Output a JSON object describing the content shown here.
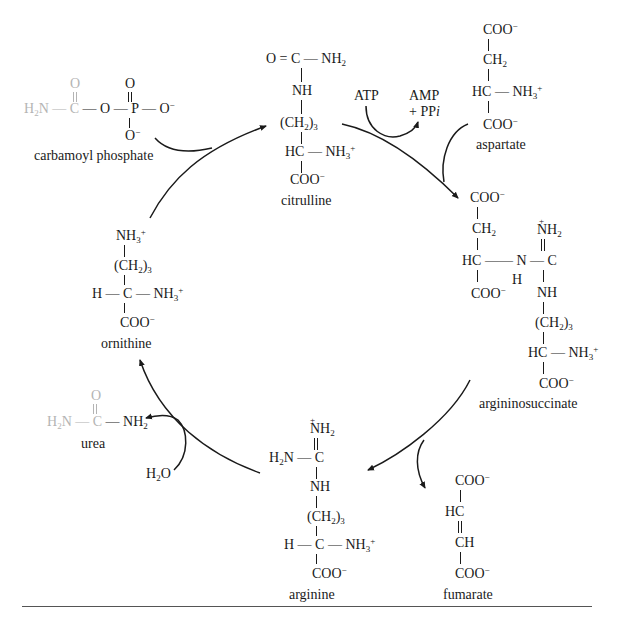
{
  "diagram": {
    "type": "metabolic-cycle",
    "compounds": {
      "carbamoyl_phosphate": {
        "label": "carbamoyl phosphate",
        "structure": [
          "O",
          "H2N — C — O — P — O−",
          "O−"
        ],
        "highlight_color": "#b4b4b4"
      },
      "citrulline": {
        "label": "citrulline",
        "structure": [
          "O = C — NH2",
          "NH",
          "(CH2)3",
          "HC — NH3+",
          "COO−"
        ]
      },
      "aspartate": {
        "label": "aspartate",
        "structure": [
          "COO−",
          "CH2",
          "HC — NH3+",
          "COO−"
        ]
      },
      "argininosuccinate": {
        "label": "argininosuccinate",
        "structure": [
          "COO−",
          "CH2",
          "HC — N — C",
          "H",
          "COO−",
          "+NH2",
          "NH",
          "(CH2)3",
          "HC — NH3+",
          "COO−"
        ]
      },
      "fumarate": {
        "label": "fumarate",
        "structure": [
          "COO−",
          "HC",
          "CH",
          "COO−"
        ]
      },
      "arginine": {
        "label": "arginine",
        "structure": [
          "+NH2",
          "H2N — C",
          "NH",
          "(CH2)3",
          "H — C — NH3+",
          "COO−"
        ]
      },
      "urea": {
        "label": "urea",
        "structure": [
          "O",
          "H2N — C — NH2"
        ],
        "highlight_color": "#b4b4b4"
      },
      "ornithine": {
        "label": "ornithine",
        "structure": [
          "NH3+",
          "(CH2)3",
          "H — C — NH3+",
          "COO−"
        ]
      }
    },
    "cofactors": {
      "atp": "ATP",
      "amp_line1": "AMP",
      "amp_line2": "+ PPi",
      "water": "H2O"
    },
    "edges": [
      {
        "from": "ornithine",
        "to": "citrulline",
        "input": "carbamoyl phosphate"
      },
      {
        "from": "citrulline",
        "to": "argininosuccinate",
        "input": "ATP",
        "output": "AMP + PPi",
        "input2": "aspartate"
      },
      {
        "from": "argininosuccinate",
        "to": "arginine",
        "output": "fumarate"
      },
      {
        "from": "arginine",
        "to": "ornithine",
        "input": "H2O",
        "output": "urea"
      }
    ],
    "colors": {
      "ink": "#1a1a1a",
      "highlight_gray": "#b4b4b4",
      "rule": "#555555"
    }
  }
}
